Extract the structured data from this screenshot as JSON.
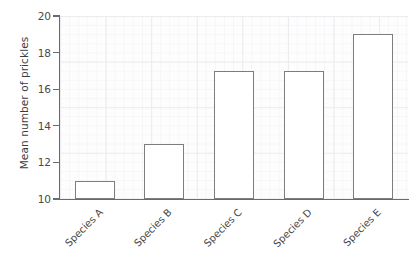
{
  "chart_data": {
    "type": "bar",
    "title": "",
    "xlabel": "",
    "ylabel": "Mean number of prickles",
    "categories": [
      "Species A",
      "Species B",
      "Species C",
      "Species D",
      "Species E"
    ],
    "values": [
      11,
      13,
      17,
      17,
      19
    ],
    "ylim": [
      10,
      20
    ],
    "yticks": [
      10,
      12,
      14,
      16,
      18,
      20
    ],
    "ytick_labels": [
      "10",
      "12",
      "14",
      "16",
      "18",
      "20"
    ],
    "grid": true,
    "legend": null,
    "bar_facecolor": "#ffffff",
    "bar_edgecolor": "#7d7d7d",
    "grid_color": "#ececf0",
    "axis_color": "#6b6b6b",
    "background": "#ffffff",
    "plot_background": "#fdfdfd",
    "xtick_label_rotation": -45
  }
}
